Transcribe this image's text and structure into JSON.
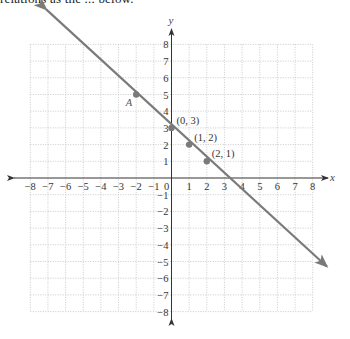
{
  "header": {
    "clipped_text": "relations as the ... below."
  },
  "chart_data": {
    "type": "line",
    "title": "",
    "xlabel": "x",
    "ylabel": "y",
    "xlim": [
      -8,
      8
    ],
    "ylim": [
      -8,
      8
    ],
    "grid": true,
    "grid_style": "dotted",
    "x_ticks": [
      -8,
      -7,
      -6,
      -5,
      -4,
      -3,
      -2,
      -1,
      0,
      1,
      2,
      3,
      4,
      5,
      6,
      7,
      8
    ],
    "y_ticks": [
      -8,
      -7,
      -6,
      -5,
      -4,
      -3,
      -2,
      -1,
      1,
      2,
      3,
      4,
      5,
      6,
      7,
      8
    ],
    "x_tick_labels": [
      "−8",
      "−7",
      "−6",
      "−5",
      "−4",
      "−3",
      "−2",
      "−1",
      "0",
      "1",
      "2",
      "3",
      "4",
      "5",
      "6",
      "7",
      "8"
    ],
    "y_tick_labels": [
      "−8",
      "−7",
      "−6",
      "−5",
      "−4",
      "−3",
      "−2",
      "−1",
      "1",
      "2",
      "3",
      "4",
      "5",
      "6",
      "7",
      "8"
    ],
    "series": [
      {
        "name": "y = -x + 3",
        "equation": "y = -x + 3",
        "slope": -1,
        "intercept": 3,
        "line_start": [
          -7.1,
          10.1
        ],
        "line_end": [
          8.8,
          -5.3
        ],
        "arrows": "both",
        "color": "#7a7a7a"
      }
    ],
    "points": [
      {
        "x": -2,
        "y": 5,
        "label": "A",
        "italic": true
      },
      {
        "x": 0,
        "y": 3,
        "label": "(0, 3)",
        "italic": false
      },
      {
        "x": 1,
        "y": 2,
        "label": "(1, 2)",
        "italic": false
      },
      {
        "x": 2,
        "y": 1,
        "label": "(2, 1)",
        "italic": false
      }
    ]
  },
  "colors": {
    "axis": "#333333",
    "grid": "#bdbdbd",
    "line": "#7a7a7a",
    "point": "#7a7a7a"
  }
}
